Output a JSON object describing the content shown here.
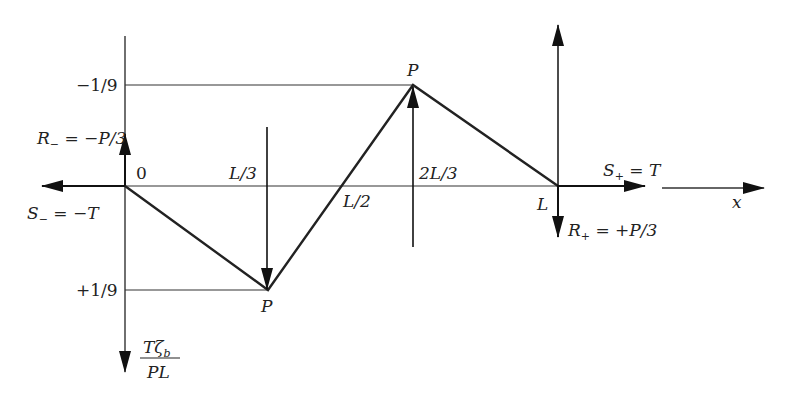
{
  "diagram": {
    "type": "influence-line",
    "axis_labels": {
      "x": "x",
      "y_numerator": "Tζ_b",
      "y_denominator": "PL"
    },
    "tick_labels_x": [
      "0",
      "L/3",
      "L/2",
      "2L/3",
      "L"
    ],
    "tick_labels_y": [
      "−1/9",
      "+1/9"
    ],
    "loads": [
      {
        "label": "P",
        "position": "L/3",
        "direction": "down"
      },
      {
        "label": "P",
        "position": "2L/3",
        "direction": "up"
      }
    ],
    "reactions": {
      "R_minus": "R_ = −P/3",
      "S_minus": "S_ = −T",
      "S_plus": "S+ = T",
      "R_plus": "R+ = +P/3"
    },
    "labels": {
      "zero": "0",
      "l3": "L/3",
      "l2": "L/2",
      "two_l3": "2L/3",
      "l": "L",
      "minus_ninth": "−1/9",
      "plus_ninth": "+1/9",
      "p_top": "P",
      "p_bottom": "P",
      "x": "x"
    },
    "polyline_points": [
      {
        "x": "0",
        "y": 0
      },
      {
        "x": "L/3",
        "y": 0.1111
      },
      {
        "x": "L/2",
        "y": 0
      },
      {
        "x": "2L/3",
        "y": -0.1111
      },
      {
        "x": "L",
        "y": 0
      }
    ]
  }
}
